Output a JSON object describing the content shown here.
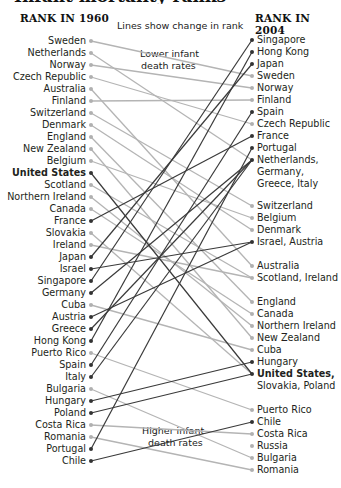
{
  "title_fragment": "Infant mortality ranks",
  "chart_data": {
    "type": "slope",
    "title": "",
    "subtitle": "Lines show change in rank",
    "left_header": "RANK IN 1960",
    "right_header": "RANK IN 2004",
    "annotations": {
      "top_note": "Lines show change in rank",
      "lower": [
        "Lower infant",
        "death rates"
      ],
      "higher": [
        "Higher infant",
        "death rates"
      ]
    },
    "colors": {
      "rise": "#3a3a3a",
      "fall": "#b4b4b4",
      "dot_rise": "#333333",
      "dot_fall": "#b0b0b0"
    },
    "left": [
      {
        "name": "Sweden",
        "rank": 1,
        "y": 41,
        "dir": "fall",
        "to": "Sweden"
      },
      {
        "name": "Netherlands",
        "rank": 2,
        "y": 53,
        "dir": "fall",
        "to": "Netherlands"
      },
      {
        "name": "Norway",
        "rank": 3,
        "y": 65,
        "dir": "fall",
        "to": "Norway"
      },
      {
        "name": "Czech Republic",
        "rank": 4,
        "y": 77,
        "dir": "fall",
        "to": "Czech Republic"
      },
      {
        "name": "Australia",
        "rank": 5,
        "y": 89,
        "dir": "fall",
        "to": "Australia"
      },
      {
        "name": "Finland",
        "rank": 6,
        "y": 101,
        "dir": "fall",
        "to": "Finland"
      },
      {
        "name": "Switzerland",
        "rank": 7,
        "y": 113,
        "dir": "fall",
        "to": "Switzerland"
      },
      {
        "name": "Denmark",
        "rank": 8,
        "y": 125,
        "dir": "fall",
        "to": "Denmark"
      },
      {
        "name": "England",
        "rank": 9,
        "y": 137,
        "dir": "fall",
        "to": "England"
      },
      {
        "name": "New Zealand",
        "rank": 10,
        "y": 149,
        "dir": "fall",
        "to": "New Zealand"
      },
      {
        "name": "Belgium",
        "rank": 11,
        "y": 161,
        "dir": "fall",
        "to": "Belgium"
      },
      {
        "name": "United States",
        "rank": 12,
        "y": 173,
        "dir": "rise",
        "bold": true,
        "to": "United States"
      },
      {
        "name": "Scotland",
        "rank": 13,
        "y": 185,
        "dir": "fall",
        "to": "Scotland"
      },
      {
        "name": "Northern Ireland",
        "rank": 14,
        "y": 197,
        "dir": "fall",
        "to": "Northern Ireland"
      },
      {
        "name": "Canada",
        "rank": 15,
        "y": 209,
        "dir": "fall",
        "to": "Canada"
      },
      {
        "name": "France",
        "rank": 16,
        "y": 221,
        "dir": "rise",
        "to": "France"
      },
      {
        "name": "Slovakia",
        "rank": 17,
        "y": 233,
        "dir": "fall",
        "to": "Slovakia"
      },
      {
        "name": "Ireland",
        "rank": 18,
        "y": 245,
        "dir": "fall",
        "to": "Ireland"
      },
      {
        "name": "Japan",
        "rank": 19,
        "y": 257,
        "dir": "rise",
        "to": "Japan"
      },
      {
        "name": "Israel",
        "rank": 20,
        "y": 269,
        "dir": "rise",
        "to": "Israel"
      },
      {
        "name": "Singapore",
        "rank": 21,
        "y": 281,
        "dir": "rise",
        "to": "Singapore"
      },
      {
        "name": "Germany",
        "rank": 22,
        "y": 293,
        "dir": "rise",
        "to": "Germany"
      },
      {
        "name": "Cuba",
        "rank": 23,
        "y": 305,
        "dir": "fall",
        "to": "Cuba"
      },
      {
        "name": "Austria",
        "rank": 24,
        "y": 317,
        "dir": "rise",
        "to": "Austria"
      },
      {
        "name": "Greece",
        "rank": 25,
        "y": 329,
        "dir": "rise",
        "to": "Greece"
      },
      {
        "name": "Hong Kong",
        "rank": 26,
        "y": 341,
        "dir": "rise",
        "to": "Hong Kong"
      },
      {
        "name": "Puerto Rico",
        "rank": 27,
        "y": 353,
        "dir": "fall",
        "to": "Puerto Rico"
      },
      {
        "name": "Spain",
        "rank": 28,
        "y": 365,
        "dir": "rise",
        "to": "Spain"
      },
      {
        "name": "Italy",
        "rank": 29,
        "y": 377,
        "dir": "rise",
        "to": "Italy"
      },
      {
        "name": "Bulgaria",
        "rank": 30,
        "y": 389,
        "dir": "fall",
        "to": "Bulgaria"
      },
      {
        "name": "Hungary",
        "rank": 31,
        "y": 401,
        "dir": "rise",
        "to": "Hungary"
      },
      {
        "name": "Poland",
        "rank": 32,
        "y": 413,
        "dir": "rise",
        "to": "Poland"
      },
      {
        "name": "Costa Rica",
        "rank": 33,
        "y": 425,
        "dir": "fall",
        "to": "Costa Rica"
      },
      {
        "name": "Romania",
        "rank": 34,
        "y": 437,
        "dir": "fall",
        "to": "Romania"
      },
      {
        "name": "Portugal",
        "rank": 35,
        "y": 449,
        "dir": "rise",
        "to": "Portugal"
      },
      {
        "name": "Chile",
        "rank": 36,
        "y": 461,
        "dir": "rise",
        "to": "Chile"
      }
    ],
    "right": [
      {
        "label": "Singapore",
        "y": 40,
        "dot": "rise",
        "members": [
          "Singapore"
        ]
      },
      {
        "label": "Hong Kong",
        "y": 52,
        "dot": "rise",
        "members": [
          "Hong Kong"
        ]
      },
      {
        "label": "Japan",
        "y": 64,
        "dot": "rise",
        "members": [
          "Japan"
        ]
      },
      {
        "label": "Sweden",
        "y": 76,
        "dot": "fall",
        "members": [
          "Sweden"
        ]
      },
      {
        "label": "Norway",
        "y": 88,
        "dot": "fall",
        "members": [
          "Norway"
        ]
      },
      {
        "label": "Finland",
        "y": 100,
        "dot": "fall",
        "members": [
          "Finland"
        ]
      },
      {
        "label": "Spain",
        "y": 112,
        "dot": "rise",
        "members": [
          "Spain"
        ]
      },
      {
        "label": "Czech Republic",
        "y": 124,
        "dot": "fall",
        "members": [
          "Czech Republic"
        ]
      },
      {
        "label": "France",
        "y": 136,
        "dot": "rise",
        "members": [
          "France"
        ]
      },
      {
        "label": "Portugal",
        "y": 148,
        "dot": "rise",
        "members": [
          "Portugal"
        ]
      },
      {
        "label": "Netherlands,",
        "label2": "Germany,",
        "label3": "Greece, Italy",
        "y": 160,
        "dot": "rise",
        "members": [
          "Netherlands",
          "Germany",
          "Greece",
          "Italy"
        ]
      },
      {
        "label": "Switzerland",
        "y": 206,
        "dot": "fall",
        "members": [
          "Switzerland"
        ]
      },
      {
        "label": "Belgium",
        "y": 218,
        "dot": "fall",
        "members": [
          "Belgium"
        ]
      },
      {
        "label": "Denmark",
        "y": 230,
        "dot": "fall",
        "members": [
          "Denmark"
        ]
      },
      {
        "label": "Israel, Austria",
        "y": 242,
        "dot": "rise",
        "members": [
          "Israel",
          "Austria"
        ]
      },
      {
        "label": "Australia",
        "y": 266,
        "dot": "fall",
        "members": [
          "Australia"
        ]
      },
      {
        "label": "Scotland, Ireland",
        "y": 278,
        "dot": "fall",
        "members": [
          "Scotland",
          "Ireland"
        ]
      },
      {
        "label": "England",
        "y": 302,
        "dot": "fall",
        "members": [
          "England"
        ]
      },
      {
        "label": "Canada",
        "y": 314,
        "dot": "fall",
        "members": [
          "Canada"
        ]
      },
      {
        "label": "Northern Ireland",
        "y": 326,
        "dot": "fall",
        "members": [
          "Northern Ireland"
        ]
      },
      {
        "label": "New Zealand",
        "y": 338,
        "dot": "fall",
        "members": [
          "New Zealand"
        ]
      },
      {
        "label": "Cuba",
        "y": 350,
        "dot": "fall",
        "members": [
          "Cuba"
        ]
      },
      {
        "label": "Hungary",
        "y": 362,
        "dot": "rise",
        "members": [
          "Hungary"
        ]
      },
      {
        "label": "United States,",
        "label2": "Slovakia, Poland",
        "y": 374,
        "dot": "rise",
        "bold": true,
        "members": [
          "United States",
          "Slovakia",
          "Poland"
        ]
      },
      {
        "label": "Puerto Rico",
        "y": 410,
        "dot": "fall",
        "members": [
          "Puerto Rico"
        ]
      },
      {
        "label": "Chile",
        "y": 422,
        "dot": "rise",
        "members": [
          "Chile"
        ]
      },
      {
        "label": "Costa Rica",
        "y": 434,
        "dot": "fall",
        "members": [
          "Costa Rica"
        ]
      },
      {
        "label": "Russia",
        "y": 446,
        "dot": "fall",
        "members": [
          "Russia"
        ]
      },
      {
        "label": "Bulgaria",
        "y": 458,
        "dot": "fall",
        "members": [
          "Bulgaria"
        ]
      },
      {
        "label": "Romania",
        "y": 470,
        "dot": "fall",
        "members": [
          "Romania"
        ]
      }
    ]
  }
}
